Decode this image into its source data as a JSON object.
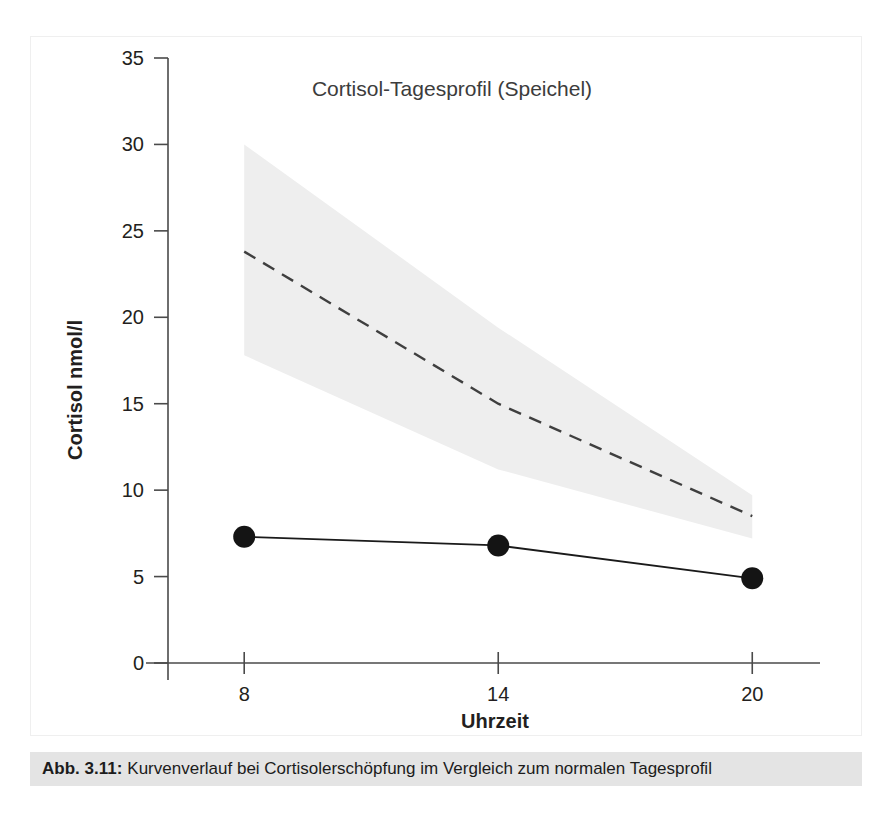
{
  "figure": {
    "caption_number": "Abb. 3.11:",
    "caption_text": "Kurvenverlauf bei Cortisolerschöpfung im Vergleich zum normalen Tagesprofil",
    "frame_color": "#efefef",
    "caption_bar_color": "#e4e4e4"
  },
  "chart_data": {
    "type": "line",
    "title": "Cortisol-Tagesprofil (Speichel)",
    "xlabel": "Uhrzeit",
    "ylabel": "Cortisol nmol/l",
    "xlim": [
      6.2,
      21.6
    ],
    "ylim": [
      0,
      35
    ],
    "grid": false,
    "legend": "none",
    "x_ticks": [
      8,
      14,
      20
    ],
    "x_tick_labels": [
      "8",
      "14",
      "20"
    ],
    "y_ticks": [
      0,
      5,
      10,
      15,
      20,
      25,
      30,
      35
    ],
    "y_tick_labels": [
      "0",
      "5",
      "10",
      "15",
      "20",
      "25",
      "30",
      "35"
    ],
    "x": [
      8,
      14,
      20
    ],
    "series": [
      {
        "name": "Cortisolerschöpfung",
        "style": "solid-with-markers",
        "color": "#141414",
        "values": [
          7.3,
          6.8,
          4.9
        ]
      },
      {
        "name": "Normales Tagesprofil (Referenz-Mittelwert)",
        "style": "dashed",
        "color": "#3f3f3f",
        "values": [
          23.8,
          15.0,
          8.5
        ]
      }
    ],
    "reference_band": {
      "name": "Normalbereich",
      "color": "#eeeeee",
      "x": [
        8,
        14,
        20
      ],
      "upper": [
        30.0,
        19.4,
        9.7
      ],
      "lower": [
        17.8,
        11.2,
        7.2
      ]
    }
  }
}
